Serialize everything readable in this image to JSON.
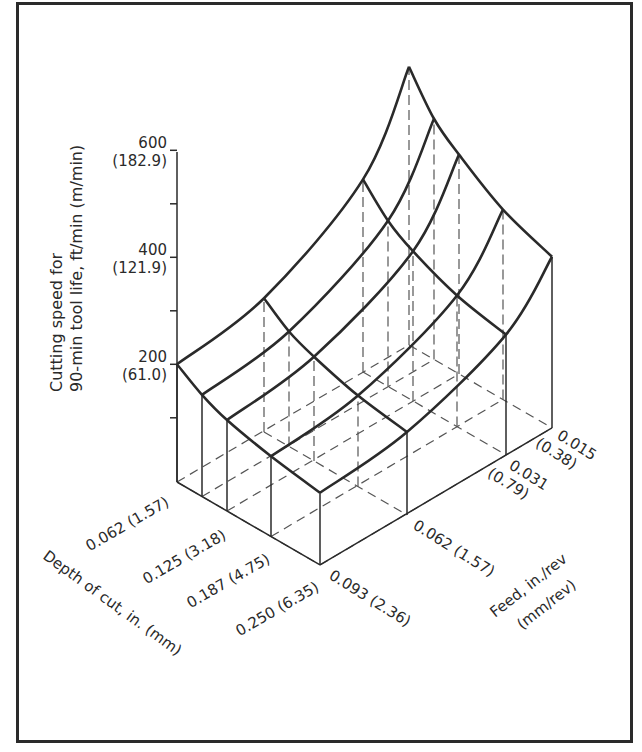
{
  "chart_data": {
    "type": "surface-3d",
    "title": "",
    "zlabel_line1": "Cutting speed for",
    "zlabel_line2": "90-min tool life, ft/min (m/min)",
    "xlabel": "Depth of cut, in. (mm)",
    "ylabel_line1": "Feed, in./rev",
    "ylabel_line2": "(mm/rev)",
    "z_ticks": [
      {
        "value": 200,
        "label": "200",
        "metric": "(61.0)"
      },
      {
        "value": 400,
        "label": "400",
        "metric": "(121.9)"
      },
      {
        "value": 600,
        "label": "600",
        "metric": "(182.9)"
      }
    ],
    "zlim": [
      0,
      600
    ],
    "depth_ticks": [
      {
        "label": "0.062 (1.57)"
      },
      {
        "label": "0.125 (3.18)"
      },
      {
        "label": "0.187 (4.75)"
      },
      {
        "label": "0.250 (6.35)"
      }
    ],
    "feed_ticks": [
      {
        "label": "0.093 (2.36)"
      },
      {
        "label": "0.062 (1.57)"
      },
      {
        "label": "0.031",
        "metric": "(0.79)"
      },
      {
        "label": "0.015",
        "metric": "(0.38)"
      }
    ],
    "depth_values_in": [
      0.062,
      0.094,
      0.125,
      0.187,
      0.25
    ],
    "feed_values_in": [
      0.093,
      0.062,
      0.031,
      0.015
    ],
    "z_values_ftmin": [
      [
        220,
        250,
        360,
        520
      ],
      [
        190,
        215,
        310,
        450
      ],
      [
        170,
        195,
        280,
        410
      ],
      [
        150,
        170,
        245,
        355
      ],
      [
        135,
        155,
        225,
        320
      ]
    ],
    "grid": true,
    "legend": "none"
  }
}
